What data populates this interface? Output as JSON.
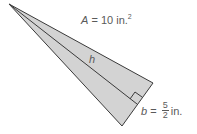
{
  "diagram": {
    "shape": "triangle",
    "fill_color": "#d3d3d3",
    "stroke_color": "#333333",
    "labels": {
      "area": {
        "variable": "A",
        "equals": " = ",
        "value": "10 in.",
        "exponent": "2"
      },
      "height": {
        "variable": "h"
      },
      "base": {
        "variable": "b",
        "equals": " = ",
        "numerator": "5",
        "denominator": "2",
        "unit": "in."
      }
    },
    "right_angle_marker": true
  }
}
